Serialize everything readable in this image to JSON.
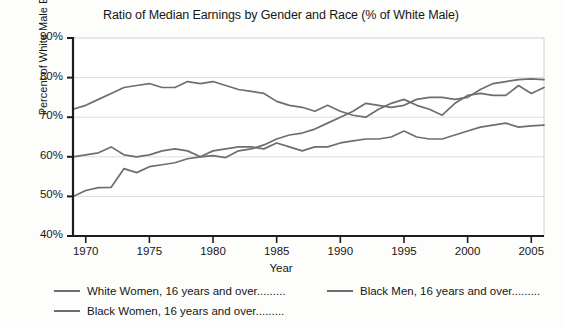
{
  "chart_data": {
    "type": "line",
    "title": "Ratio of Median Earnings by Gender and Race (% of  White Male)",
    "xlabel": "Year",
    "ylabel": "Percent of White Male Earnings",
    "xlim": [
      1969,
      2006
    ],
    "ylim": [
      40,
      90
    ],
    "ytick_labels": [
      "90%",
      "80%",
      "70%",
      "60%",
      "50%",
      "40%"
    ],
    "ytick_values": [
      90,
      80,
      70,
      60,
      50,
      40
    ],
    "xtick_labels": [
      "1970",
      "1975",
      "1980",
      "1985",
      "1990",
      "1995",
      "2000",
      "2005"
    ],
    "xtick_values": [
      1970,
      1975,
      1980,
      1985,
      1990,
      1995,
      2000,
      2005
    ],
    "grid": "horizontal",
    "legend_position": "below-plot",
    "line_color": "#6e6e6e",
    "x": [
      1969,
      1970,
      1971,
      1972,
      1973,
      1974,
      1975,
      1976,
      1977,
      1978,
      1979,
      1980,
      1981,
      1982,
      1983,
      1984,
      1985,
      1986,
      1987,
      1988,
      1989,
      1990,
      1991,
      1992,
      1993,
      1994,
      1995,
      1996,
      1997,
      1998,
      1999,
      2000,
      2001,
      2002,
      2003,
      2004,
      2005,
      2006
    ],
    "series": [
      {
        "name": "White Women, 16 years and over.........",
        "values": [
          50.0,
          51.5,
          52.2,
          52.3,
          57.0,
          56.0,
          57.5,
          58.0,
          58.5,
          59.5,
          60.0,
          60.3,
          59.8,
          61.5,
          62.0,
          63.0,
          64.5,
          65.5,
          66.0,
          67.0,
          68.5,
          70.0,
          71.5,
          73.5,
          73.0,
          72.5,
          73.0,
          74.5,
          75.0,
          75.0,
          74.5,
          75.0,
          77.0,
          78.5,
          79.0,
          79.5,
          79.7,
          79.5
        ]
      },
      {
        "name": "Black Men, 16 years and over.........",
        "values": [
          72.0,
          73.0,
          74.5,
          76.0,
          77.5,
          78.0,
          78.5,
          77.5,
          77.5,
          79.0,
          78.5,
          79.0,
          78.0,
          77.0,
          76.5,
          76.0,
          74.0,
          73.0,
          72.5,
          71.5,
          73.0,
          71.5,
          70.5,
          70.0,
          72.0,
          73.5,
          74.5,
          73.0,
          72.0,
          70.5,
          73.5,
          75.5,
          76.0,
          75.5,
          75.5,
          78.0,
          76.0,
          77.5
        ]
      },
      {
        "name": "Black Women, 16 years and over.........",
        "values": [
          60.0,
          60.5,
          61.0,
          62.5,
          60.5,
          60.0,
          60.5,
          61.5,
          62.0,
          61.5,
          60.0,
          61.5,
          62.0,
          62.5,
          62.5,
          62.0,
          63.5,
          62.5,
          61.5,
          62.5,
          62.5,
          63.5,
          64.0,
          64.5,
          64.5,
          65.0,
          66.5,
          65.0,
          64.5,
          64.5,
          65.5,
          66.5,
          67.5,
          68.0,
          68.5,
          67.5,
          67.8,
          68.0
        ]
      }
    ]
  }
}
